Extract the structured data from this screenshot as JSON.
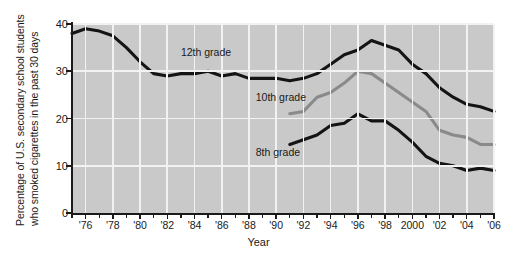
{
  "chart_data": {
    "type": "line",
    "title": "",
    "subtitle": "",
    "xlabel": "Year",
    "ylabel": "Percentage of U.S. secondary school students who smoked cigarettes in the past 30 days",
    "ylabel_line1": "Percentage of U.S. secondary school students",
    "ylabel_line2": "who smoked cigarettes in the past 30 days",
    "xlim": [
      1975,
      2006
    ],
    "ylim": [
      0,
      40
    ],
    "yticks": [
      0,
      10,
      20,
      30,
      40
    ],
    "ytick_labels": [
      "0",
      "10",
      "20",
      "30",
      "40"
    ],
    "xticks": [
      1976,
      1978,
      1980,
      1982,
      1984,
      1986,
      1988,
      1990,
      1992,
      1994,
      1996,
      1998,
      2000,
      2002,
      2004,
      2006
    ],
    "xtick_labels": [
      "'76",
      "'78",
      "'80",
      "'82",
      "'84",
      "'86",
      "'88",
      "'90",
      "'92",
      "'94",
      "'96",
      "'98",
      "2000",
      "'02",
      "'04",
      "'06"
    ],
    "grid": true,
    "grid_color": "#f2f2f2",
    "plot_background": "#c9c9c9",
    "legend": "inline-labels",
    "legend_position": "inline",
    "series": [
      {
        "name": "12th grade",
        "color": "#141414",
        "label_x": 1983,
        "label_y": 34,
        "x": [
          1975,
          1976,
          1977,
          1978,
          1979,
          1980,
          1981,
          1982,
          1983,
          1984,
          1985,
          1986,
          1987,
          1988,
          1989,
          1990,
          1991,
          1992,
          1993,
          1994,
          1995,
          1996,
          1997,
          1998,
          1999,
          2000,
          2001,
          2002,
          2003,
          2004,
          2005,
          2006
        ],
        "values": [
          38.0,
          39.0,
          38.5,
          37.5,
          35.0,
          32.0,
          29.5,
          29.0,
          29.5,
          29.5,
          30.0,
          29.0,
          29.5,
          28.5,
          28.5,
          28.5,
          28.0,
          28.5,
          29.5,
          31.5,
          33.5,
          34.5,
          36.5,
          35.5,
          34.5,
          31.5,
          29.5,
          26.5,
          24.5,
          23.0,
          22.5,
          21.5
        ]
      },
      {
        "name": "10th grade",
        "color": "#8a8a8a",
        "label_x": 1988.5,
        "label_y": 24.5,
        "x": [
          1991,
          1992,
          1993,
          1994,
          1995,
          1996,
          1997,
          1998,
          1999,
          2000,
          2001,
          2002,
          2003,
          2004,
          2005,
          2006
        ],
        "values": [
          21.0,
          21.5,
          24.5,
          25.5,
          27.5,
          30.0,
          29.5,
          27.5,
          25.5,
          23.5,
          21.5,
          17.5,
          16.5,
          16.0,
          14.5,
          14.5
        ]
      },
      {
        "name": "8th grade",
        "color": "#141414",
        "label_x": 1988.5,
        "label_y": 13.0,
        "x": [
          1991,
          1992,
          1993,
          1994,
          1995,
          1996,
          1997,
          1998,
          1999,
          2000,
          2001,
          2002,
          2003,
          2004,
          2005,
          2006
        ],
        "values": [
          14.5,
          15.5,
          16.5,
          18.5,
          19.0,
          21.0,
          19.5,
          19.5,
          17.5,
          15.0,
          12.0,
          10.5,
          10.0,
          9.0,
          9.5,
          9.0
        ]
      }
    ]
  }
}
